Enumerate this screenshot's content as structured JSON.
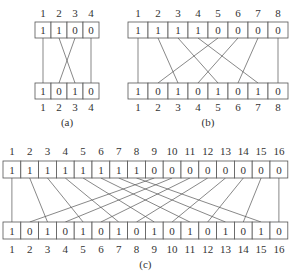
{
  "diagrams": [
    {
      "id": "a",
      "caption": "(a)",
      "n": 4,
      "top_bits": [
        "1",
        "1",
        "0",
        "0"
      ],
      "bottom_bits": [
        "1",
        "0",
        "1",
        "0"
      ],
      "labels": [
        "1",
        "2",
        "3",
        "4"
      ],
      "geom": {
        "x0": 35,
        "cw": 16,
        "top_y": 22,
        "bot_y": 83,
        "h": 16,
        "top_lbl_y": 17,
        "bot_lbl_y": 111,
        "cap_y": 126
      }
    },
    {
      "id": "b",
      "caption": "(b)",
      "n": 8,
      "top_bits": [
        "1",
        "1",
        "1",
        "1",
        "0",
        "0",
        "0",
        "0"
      ],
      "bottom_bits": [
        "1",
        "0",
        "1",
        "0",
        "1",
        "0",
        "1",
        "0"
      ],
      "labels": [
        "1",
        "2",
        "3",
        "4",
        "5",
        "6",
        "7",
        "8"
      ],
      "geom": {
        "x0": 128,
        "cw": 20,
        "top_y": 22,
        "bot_y": 83,
        "h": 16,
        "top_lbl_y": 17,
        "bot_lbl_y": 111,
        "cap_y": 126
      }
    },
    {
      "id": "c",
      "caption": "(c)",
      "n": 16,
      "top_bits": [
        "1",
        "1",
        "1",
        "1",
        "1",
        "1",
        "1",
        "1",
        "0",
        "0",
        "0",
        "0",
        "0",
        "0",
        "0",
        "0"
      ],
      "bottom_bits": [
        "1",
        "0",
        "1",
        "0",
        "1",
        "0",
        "1",
        "0",
        "1",
        "0",
        "1",
        "0",
        "1",
        "0",
        "1",
        "0"
      ],
      "labels": [
        "1",
        "2",
        "3",
        "4",
        "5",
        "6",
        "7",
        "8",
        "9",
        "10",
        "11",
        "12",
        "13",
        "14",
        "15",
        "16"
      ],
      "geom": {
        "x0": 3,
        "cw": 17.8,
        "top_y": 161,
        "bot_y": 222,
        "h": 17,
        "top_lbl_y": 155,
        "bot_lbl_y": 253,
        "cap_y": 268
      }
    }
  ],
  "wiring": "perfect-shuffle: top position i in first half connects to bottom 2i-1; top position j in second half connects to bottom 2(j-n/2)"
}
